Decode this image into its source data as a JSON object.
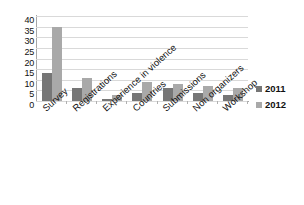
{
  "chart_data": {
    "type": "bar",
    "title": "",
    "xlabel": "",
    "ylabel": "",
    "ylim": [
      0,
      40
    ],
    "yticks": [
      40,
      35,
      30,
      25,
      20,
      15,
      10,
      5,
      0
    ],
    "grid": true,
    "legend_position": "right",
    "categories": [
      "Survey",
      "Registrations",
      "Experience in violence",
      "Countries",
      "Submissions",
      "Non organizers",
      "Workshop"
    ],
    "series": [
      {
        "name": "2011",
        "color": "#767676",
        "values": [
          13,
          6,
          1,
          4,
          6,
          4,
          3
        ]
      },
      {
        "name": "2012",
        "color": "#a9a9a9",
        "values": [
          35,
          11,
          3,
          9,
          8,
          7,
          6
        ]
      }
    ]
  },
  "legend": {
    "items": [
      {
        "label": "2011"
      },
      {
        "label": "2012"
      }
    ]
  }
}
